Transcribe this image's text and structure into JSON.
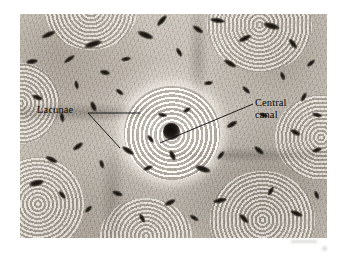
{
  "figure": {
    "kind": "light-micrograph",
    "background_color": "#ffffff",
    "plate": {
      "x": 20,
      "y": 14,
      "width": 307,
      "height": 224,
      "tone": "grayscale-sepia",
      "base_color": "#bfb9b1",
      "highlight_color": "#f6f3ef",
      "shadow_color": "#1b1815"
    }
  },
  "annotations": {
    "line_color": "#0b0b0b",
    "items": [
      {
        "id": "lacunae",
        "label": "Lacunae",
        "text_x": 37,
        "text_y": 104,
        "leaders": [
          {
            "x1": 88,
            "y1": 113,
            "x2": 140,
            "y2": 113
          },
          {
            "x1": 88,
            "y1": 113,
            "x2": 120,
            "y2": 148
          }
        ]
      },
      {
        "id": "central-canal",
        "label": "Central\ncanal",
        "text_x": 255,
        "text_y": 97,
        "leaders": [
          {
            "x1": 253,
            "y1": 104,
            "x2": 160,
            "y2": 143
          }
        ]
      }
    ]
  },
  "features": {
    "central_canal": {
      "cx": 49.3,
      "cy": 52.3,
      "rx": 2.8,
      "ry": 3.8,
      "unit": "percent-of-plate"
    },
    "central_osteon": {
      "cx": 49.5,
      "cy": 53,
      "rx": 15.5,
      "ry": 21,
      "lamellae_rings": 9,
      "unit": "percent-of-plate"
    },
    "satellite_osteons": [
      {
        "id": "top-right",
        "left": 61,
        "top": -16,
        "width": 34,
        "height": 42
      },
      {
        "id": "right",
        "left": 83,
        "top": 36,
        "width": 30,
        "height": 38
      },
      {
        "id": "bottom-right",
        "left": 62,
        "top": 70,
        "width": 34,
        "height": 44
      },
      {
        "id": "bottom-left",
        "left": -9,
        "top": 64,
        "width": 30,
        "height": 42
      },
      {
        "id": "left",
        "left": -13,
        "top": 22,
        "width": 26,
        "height": 36
      },
      {
        "id": "top-left",
        "left": 8,
        "top": -20,
        "width": 30,
        "height": 36
      },
      {
        "id": "bottom",
        "left": 26,
        "top": 82,
        "width": 30,
        "height": 34
      }
    ],
    "lacunae": [
      {
        "left": 7,
        "top": 8,
        "w": 5.0,
        "h": 2.4,
        "rot": -24
      },
      {
        "left": 14,
        "top": 19,
        "w": 4.2,
        "h": 2.0,
        "rot": -35
      },
      {
        "left": 21,
        "top": 12,
        "w": 6.0,
        "h": 2.6,
        "rot": -18
      },
      {
        "left": 26,
        "top": 25,
        "w": 3.4,
        "h": 2.2,
        "rot": 12
      },
      {
        "left": 31,
        "top": 34,
        "w": 3.0,
        "h": 2.0,
        "rot": 38
      },
      {
        "left": 22,
        "top": 40,
        "w": 3.6,
        "h": 2.2,
        "rot": 66
      },
      {
        "left": 17,
        "top": 31,
        "w": 3.0,
        "h": 1.8,
        "rot": 78
      },
      {
        "left": 12,
        "top": 45,
        "w": 3.2,
        "h": 2.0,
        "rot": 80
      },
      {
        "left": 4,
        "top": 36,
        "w": 3.6,
        "h": 2.2,
        "rot": 20
      },
      {
        "left": 33,
        "top": 19,
        "w": 3.2,
        "h": 2.0,
        "rot": -10
      },
      {
        "left": 38,
        "top": 8,
        "w": 5.4,
        "h": 2.6,
        "rot": 22
      },
      {
        "left": 44,
        "top": 2,
        "w": 4.6,
        "h": 2.4,
        "rot": -48
      },
      {
        "left": 50,
        "top": 16,
        "w": 3.2,
        "h": 2.0,
        "rot": 60
      },
      {
        "left": 56,
        "top": 6,
        "w": 4.0,
        "h": 2.2,
        "rot": 34
      },
      {
        "left": 62,
        "top": 2,
        "w": 5.0,
        "h": 2.4,
        "rot": 8
      },
      {
        "left": 71,
        "top": 10,
        "w": 4.4,
        "h": 2.4,
        "rot": -26
      },
      {
        "left": 79,
        "top": 4,
        "w": 5.6,
        "h": 2.6,
        "rot": 16
      },
      {
        "left": 87,
        "top": 12,
        "w": 3.8,
        "h": 2.2,
        "rot": 52
      },
      {
        "left": 93,
        "top": 21,
        "w": 3.4,
        "h": 2.0,
        "rot": -40
      },
      {
        "left": 84,
        "top": 27,
        "w": 3.0,
        "h": 1.9,
        "rot": 70
      },
      {
        "left": 66,
        "top": 21,
        "w": 4.6,
        "h": 2.4,
        "rot": 30
      },
      {
        "left": 60,
        "top": 30,
        "w": 3.0,
        "h": 2.0,
        "rot": -8
      },
      {
        "left": 72,
        "top": 33,
        "w": 3.4,
        "h": 2.0,
        "rot": 44
      },
      {
        "left": 91,
        "top": 36,
        "w": 3.2,
        "h": 2.0,
        "rot": -62
      },
      {
        "left": 78,
        "top": 44,
        "w": 3.0,
        "h": 1.8,
        "rot": 18
      },
      {
        "left": 67,
        "top": 48,
        "w": 3.8,
        "h": 2.2,
        "rot": -30
      },
      {
        "left": 88,
        "top": 52,
        "w": 3.6,
        "h": 2.2,
        "rot": 28
      },
      {
        "left": 95,
        "top": 60,
        "w": 3.2,
        "h": 2.0,
        "rot": -16
      },
      {
        "left": 76,
        "top": 60,
        "w": 4.0,
        "h": 2.2,
        "rot": 40
      },
      {
        "left": 64,
        "top": 62,
        "w": 3.4,
        "h": 2.0,
        "rot": -52
      },
      {
        "left": 57,
        "top": 68,
        "w": 5.2,
        "h": 2.6,
        "rot": 18
      },
      {
        "left": 48,
        "top": 62,
        "w": 3.6,
        "h": 2.2,
        "rot": 64
      },
      {
        "left": 40,
        "top": 68,
        "w": 3.2,
        "h": 2.0,
        "rot": -22
      },
      {
        "left": 33,
        "top": 60,
        "w": 4.4,
        "h": 2.4,
        "rot": 34
      },
      {
        "left": 25,
        "top": 66,
        "w": 3.0,
        "h": 2.0,
        "rot": 72
      },
      {
        "left": 17,
        "top": 58,
        "w": 3.8,
        "h": 2.2,
        "rot": -36
      },
      {
        "left": 8,
        "top": 64,
        "w": 4.2,
        "h": 2.4,
        "rot": 26
      },
      {
        "left": 3,
        "top": 74,
        "w": 5.0,
        "h": 2.6,
        "rot": -14
      },
      {
        "left": 12,
        "top": 80,
        "w": 3.4,
        "h": 2.0,
        "rot": 50
      },
      {
        "left": 21,
        "top": 86,
        "w": 3.0,
        "h": 1.9,
        "rot": -44
      },
      {
        "left": 30,
        "top": 79,
        "w": 3.6,
        "h": 2.2,
        "rot": 20
      },
      {
        "left": 38,
        "top": 90,
        "w": 3.2,
        "h": 2.0,
        "rot": 62
      },
      {
        "left": 47,
        "top": 83,
        "w": 4.0,
        "h": 2.2,
        "rot": -26
      },
      {
        "left": 55,
        "top": 90,
        "w": 3.4,
        "h": 2.0,
        "rot": 32
      },
      {
        "left": 63,
        "top": 82,
        "w": 4.6,
        "h": 2.4,
        "rot": -12
      },
      {
        "left": 71,
        "top": 90,
        "w": 3.8,
        "h": 2.2,
        "rot": 46
      },
      {
        "left": 80,
        "top": 78,
        "w": 3.2,
        "h": 2.0,
        "rot": -58
      },
      {
        "left": 88,
        "top": 88,
        "w": 4.2,
        "h": 2.4,
        "rot": 22
      },
      {
        "left": 95,
        "top": 80,
        "w": 3.0,
        "h": 1.9,
        "rot": 68
      },
      {
        "left": 45,
        "top": 44,
        "w": 3.0,
        "h": 1.8,
        "rot": 10
      },
      {
        "left": 53,
        "top": 42,
        "w": 2.6,
        "h": 1.7,
        "rot": -30
      },
      {
        "left": 41,
        "top": 55,
        "w": 3.0,
        "h": 1.8,
        "rot": 52
      },
      {
        "left": 2,
        "top": 20,
        "w": 4.0,
        "h": 2.2,
        "rot": -8
      },
      {
        "left": 95,
        "top": 44,
        "w": 3.4,
        "h": 2.0,
        "rot": 14
      }
    ]
  },
  "artifacts": [
    {
      "id": "smudge-bar",
      "left": 291,
      "top": 240,
      "width": 26,
      "height": 3
    },
    {
      "id": "smudge-dot",
      "left": 322,
      "top": 246,
      "width": 5,
      "height": 5
    }
  ]
}
